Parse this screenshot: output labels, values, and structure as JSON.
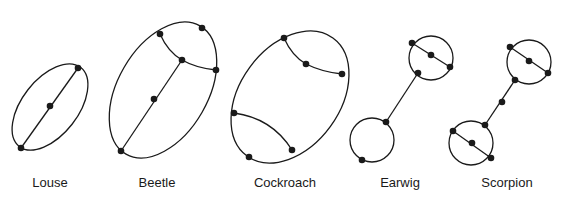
{
  "figure": {
    "stroke_color": "#1a1a1a",
    "background": "#ffffff",
    "diagrams": [
      {
        "name": "louse",
        "label": "Louse"
      },
      {
        "name": "beetle",
        "label": "Beetle"
      },
      {
        "name": "cockroach",
        "label": "Cockroach"
      },
      {
        "name": "earwig",
        "label": "Earwig"
      },
      {
        "name": "scorpion",
        "label": "Scorpion"
      }
    ]
  }
}
